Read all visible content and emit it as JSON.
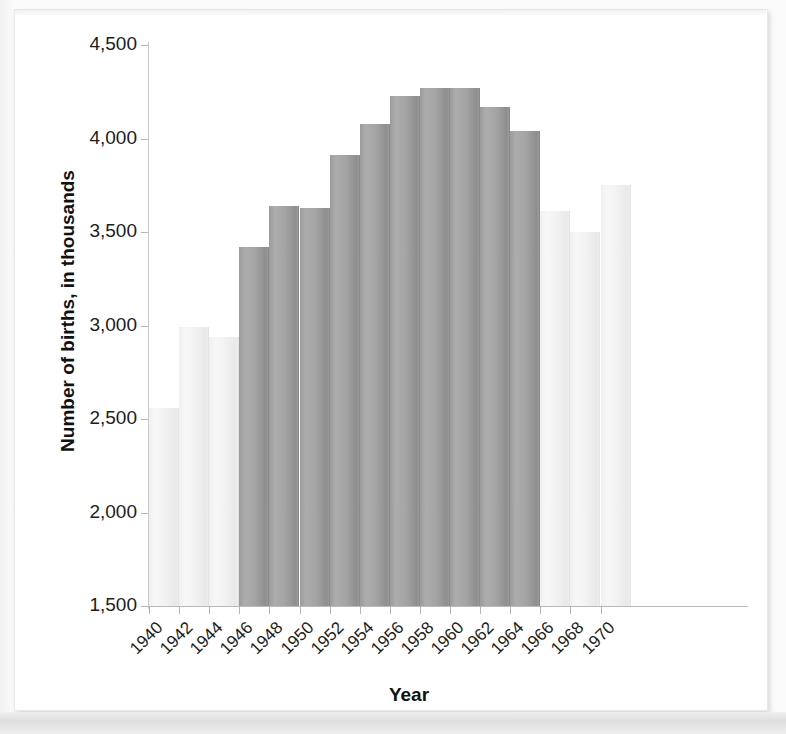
{
  "chart_data": {
    "type": "bar",
    "title": "",
    "xlabel": "Year",
    "ylabel": "Number of births, in thousands",
    "ylim": [
      1500,
      4500
    ],
    "ytick_labels": [
      "4,500",
      "4,000",
      "3,500",
      "3,000",
      "2,500",
      "2,000",
      "1,500"
    ],
    "ytick_values": [
      4500,
      4000,
      3500,
      3000,
      2500,
      2000,
      1500
    ],
    "xtick_labels": [
      "1940",
      "1942",
      "1944",
      "1946",
      "1948",
      "1950",
      "1952",
      "1954",
      "1956",
      "1958",
      "1960",
      "1962",
      "1964",
      "1966",
      "1968",
      "1970"
    ],
    "grid": false,
    "legend": "none",
    "bin_width_years": 2,
    "categories": [
      "1940",
      "1942",
      "1944",
      "1946",
      "1948",
      "1950",
      "1952",
      "1954",
      "1956",
      "1958",
      "1960",
      "1962",
      "1964",
      "1966",
      "1968",
      "1970"
    ],
    "values": [
      2560,
      2990,
      2940,
      3420,
      3640,
      3630,
      3910,
      4080,
      4230,
      4270,
      4270,
      4170,
      4040,
      3610,
      3500,
      3750
    ],
    "highlight": [
      false,
      false,
      false,
      true,
      true,
      true,
      true,
      true,
      true,
      true,
      true,
      true,
      true,
      false,
      false,
      false
    ],
    "highlight_note": "Bars from 1946 through 1965 are shaded dark (baby boom years); bars outside that span are pale.",
    "colors": {
      "bar_dark": "#a3a3a3",
      "bar_light": "#f1f1f1",
      "axis": "#b9b9b9",
      "text": "#1c1c1c",
      "page": "#ffffff"
    }
  },
  "axis": {
    "y_title": "Number of births, in thousands",
    "x_title": "Year"
  }
}
